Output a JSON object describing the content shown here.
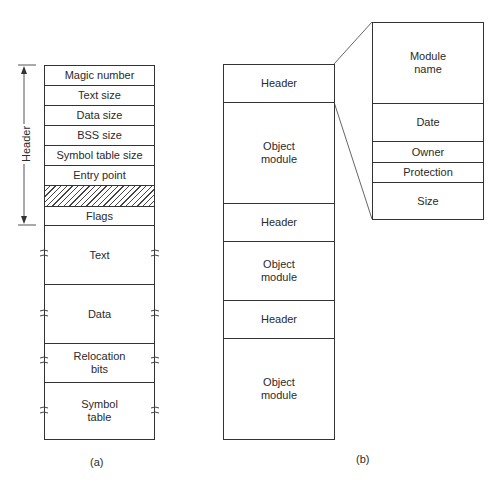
{
  "panel_a": {
    "caption": "(a)",
    "bracket_label": "Header",
    "rows": [
      {
        "label": "Magic number"
      },
      {
        "label": "Text size"
      },
      {
        "label": "Data size"
      },
      {
        "label": "BSS size"
      },
      {
        "label": "Symbol table size"
      },
      {
        "label": "Entry point"
      },
      {
        "label": ""
      },
      {
        "label": "Flags"
      },
      {
        "label": "Text"
      },
      {
        "label": "Data"
      },
      {
        "label": "Relocation bits"
      },
      {
        "label": "Symbol table"
      }
    ]
  },
  "panel_b": {
    "caption": "(b)",
    "rows": [
      {
        "label": "Header"
      },
      {
        "label": "Object module"
      },
      {
        "label": "Header"
      },
      {
        "label": "Object module"
      },
      {
        "label": "Header"
      },
      {
        "label": "Object module"
      }
    ],
    "detail_rows": [
      {
        "label": "Module name"
      },
      {
        "label": "Date"
      },
      {
        "label": "Owner"
      },
      {
        "label": "Protection"
      },
      {
        "label": "Size"
      }
    ]
  }
}
